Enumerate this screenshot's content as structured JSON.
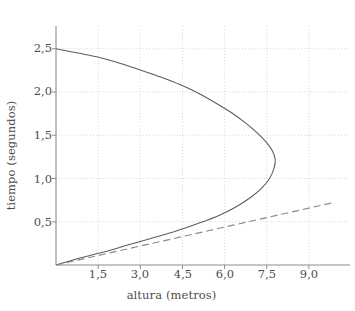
{
  "chart_data": {
    "type": "line",
    "title": "",
    "subtitle": "",
    "xlabel": "altura (metros)",
    "ylabel": "tiempo (segundos)",
    "xlim": [
      0,
      10.6
    ],
    "ylim": [
      0,
      2.72
    ],
    "xticks": [
      "1,5",
      "3,0",
      "4,5",
      "6,0",
      "7,5",
      "9,0"
    ],
    "xtick_values": [
      1.5,
      3.0,
      4.5,
      6.0,
      7.5,
      9.0
    ],
    "yticks": [
      "0,5",
      "1,0",
      "1,5",
      "2,0",
      "2,5"
    ],
    "ytick_values": [
      0.5,
      1.0,
      1.5,
      2.0,
      2.5
    ],
    "grid": true,
    "legend": "none",
    "series": [
      {
        "name": "trayectoria (parabola)",
        "style": "solid",
        "color": "#5c5c5c",
        "description": "parabola abierta hacia la izquierda, vertice cerca de (7,8 m; 1,25 s)",
        "points": [
          {
            "altura": 0.0,
            "tiempo": 2.5
          },
          {
            "altura": 0.78,
            "tiempo": 2.45
          },
          {
            "altura": 1.55,
            "tiempo": 2.4
          },
          {
            "altura": 2.3,
            "tiempo": 2.33
          },
          {
            "altura": 3.05,
            "tiempo": 2.25
          },
          {
            "altura": 3.75,
            "tiempo": 2.17
          },
          {
            "altura": 4.45,
            "tiempo": 2.08
          },
          {
            "altura": 5.1,
            "tiempo": 1.98
          },
          {
            "altura": 5.7,
            "tiempo": 1.87
          },
          {
            "altura": 6.25,
            "tiempo": 1.76
          },
          {
            "altura": 6.75,
            "tiempo": 1.64
          },
          {
            "altura": 7.15,
            "tiempo": 1.53
          },
          {
            "altura": 7.48,
            "tiempo": 1.42
          },
          {
            "altura": 7.7,
            "tiempo": 1.32
          },
          {
            "altura": 7.8,
            "tiempo": 1.22
          },
          {
            "altura": 7.76,
            "tiempo": 1.12
          },
          {
            "altura": 7.6,
            "tiempo": 1.0
          },
          {
            "altura": 7.32,
            "tiempo": 0.89
          },
          {
            "altura": 6.92,
            "tiempo": 0.78
          },
          {
            "altura": 6.4,
            "tiempo": 0.67
          },
          {
            "altura": 5.78,
            "tiempo": 0.57
          },
          {
            "altura": 5.05,
            "tiempo": 0.48
          },
          {
            "altura": 4.25,
            "tiempo": 0.39
          },
          {
            "altura": 3.4,
            "tiempo": 0.31
          },
          {
            "altura": 2.55,
            "tiempo": 0.23
          },
          {
            "altura": 1.7,
            "tiempo": 0.15
          },
          {
            "altura": 0.85,
            "tiempo": 0.08
          },
          {
            "altura": 0.0,
            "tiempo": 0.0
          }
        ]
      },
      {
        "name": "recta de referencia",
        "style": "dashed",
        "color": "#8a8a8a",
        "description": "recta discontinua desde el origen hacia la derecha",
        "points": [
          {
            "altura": 0.0,
            "tiempo": 0.0
          },
          {
            "altura": 9.85,
            "tiempo": 0.72
          }
        ]
      }
    ]
  },
  "axes": {
    "x_axis_name": "eje-horizontal",
    "y_axis_name": "eje-vertical"
  }
}
